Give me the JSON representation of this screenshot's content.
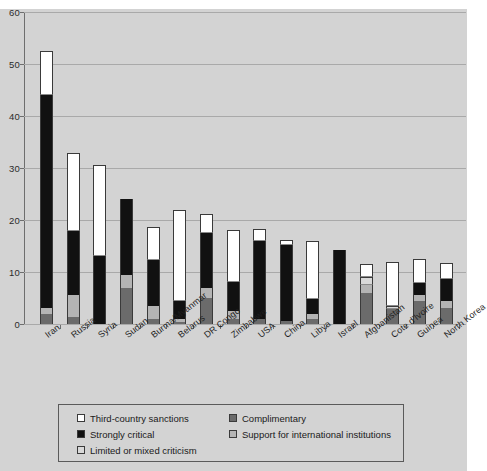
{
  "chart_data": {
    "type": "bar",
    "stacked": true,
    "title": "",
    "subtitle": "",
    "xlabel": "",
    "ylabel": "",
    "ylim": [
      0,
      60
    ],
    "ytick_values": [
      0,
      10,
      20,
      30,
      40,
      50,
      60
    ],
    "ytick_labels": [
      "0",
      "10",
      "20",
      "30",
      "40",
      "50",
      "60"
    ],
    "grid": true,
    "legend_position": "bottom",
    "categories": [
      "Iran",
      "Russia",
      "Syria",
      "Sudan",
      "Burma/Myanmar",
      "Belarus",
      "DR Congo",
      "Zimbabwe",
      "USA",
      "China",
      "Libya",
      "Israel",
      "Afghanistan",
      "Cote d'Ivoire",
      "Guinea",
      "North Korea"
    ],
    "series": [
      {
        "name": "Complimentary",
        "color": "#6b6b6b",
        "values": [
          2.0,
          1.3,
          0.0,
          7.0,
          1.0,
          0.4,
          5.0,
          1.0,
          1.0,
          0.5,
          1.0,
          0.0,
          6.0,
          2.8,
          4.5,
          3.0
        ]
      },
      {
        "name": "Support for international institutions",
        "color": "#b4b4b4",
        "values": [
          1.0,
          4.3,
          0.0,
          2.4,
          2.4,
          0.6,
          2.0,
          1.5,
          0.0,
          0.0,
          1.0,
          0.0,
          1.5,
          0.0,
          1.0,
          1.4
        ]
      },
      {
        "name": "Strongly critical",
        "color": "#111111",
        "values": [
          41.0,
          12.3,
          13.0,
          14.6,
          9.0,
          3.5,
          10.6,
          5.5,
          15.0,
          14.7,
          2.9,
          14.2,
          0.0,
          0.0,
          2.4,
          4.3
        ]
      },
      {
        "name": "Limited or mixed criticism",
        "color": "#d9d9d9",
        "values": [
          0.0,
          0.0,
          0.0,
          0.0,
          0.0,
          0.0,
          0.0,
          0.0,
          0.0,
          0.0,
          0.0,
          0.0,
          1.6,
          0.6,
          0.0,
          0.0
        ]
      },
      {
        "name": "Third-country sanctions",
        "color": "#ffffff",
        "values": [
          8.6,
          15.0,
          17.5,
          0.0,
          6.2,
          17.5,
          3.5,
          10.0,
          2.2,
          0.9,
          11.1,
          0.0,
          2.5,
          8.5,
          4.6,
          3.0
        ]
      }
    ],
    "totals": [
      52.6,
      32.9,
      30.5,
      24.0,
      18.6,
      22.0,
      21.1,
      18.0,
      18.2,
      16.1,
      16.0,
      14.2,
      11.6,
      11.9,
      12.5,
      11.7
    ]
  },
  "legend": {
    "items": [
      {
        "label": "Third-country sanctions",
        "color": "#ffffff",
        "icon": "legend-swatch-icon"
      },
      {
        "label": "Complimentary",
        "color": "#6b6b6b",
        "icon": "legend-swatch-icon"
      },
      {
        "label": "Strongly critical",
        "color": "#111111",
        "icon": "legend-swatch-icon"
      },
      {
        "label": "Support for international institutions",
        "color": "#b4b4b4",
        "icon": "legend-swatch-icon"
      },
      {
        "label": "Limited or mixed criticism",
        "color": "#d9d9d9",
        "icon": "legend-swatch-icon"
      }
    ]
  },
  "style": {
    "background": "#d3d3d3",
    "gridline_color": "#a9a9a9",
    "axis_color": "#6e6e6e",
    "text_color": "#1a1a1a"
  }
}
